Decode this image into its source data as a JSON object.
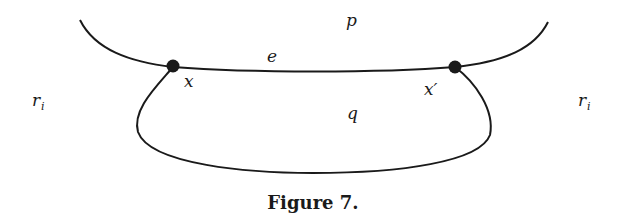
{
  "figure": {
    "caption": "Figure 7.",
    "labels": {
      "p": "p",
      "e": "e",
      "x": "x",
      "x_prime": "x′",
      "q": "q",
      "r_left": "r",
      "r_left_sub": "i",
      "r_right": "r",
      "r_right_sub": "i"
    },
    "colors": {
      "stroke": "#1a1a1a",
      "background": "#ffffff"
    }
  }
}
